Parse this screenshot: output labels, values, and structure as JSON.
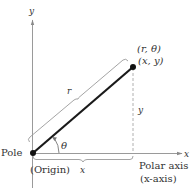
{
  "diagram": {
    "type": "polar-coordinate-system",
    "axes": {
      "y_axis_label": "y",
      "x_axis_label": "x",
      "polar_axis_label": "Polar axis",
      "polar_axis_sublabel": "(x-axis)"
    },
    "pole": {
      "label": "Pole",
      "sublabel": "(Origin)"
    },
    "point": {
      "polar_label": "(r, θ)",
      "rect_label": "(x, y)"
    },
    "segment_labels": {
      "radius": "r",
      "horizontal": "x",
      "vertical": "y",
      "angle": "θ"
    },
    "colors": {
      "axis": "#9a9a9a",
      "radius_line": "#1a1a1a",
      "bracket": "#9a9a9a",
      "dashed": "#b0b0b0",
      "text": "#333333"
    }
  }
}
